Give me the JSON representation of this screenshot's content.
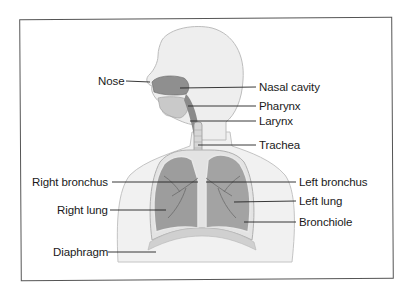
{
  "diagram": {
    "labels_left": [
      {
        "id": "nose",
        "text": "Nose",
        "x": 98,
        "y": 76
      },
      {
        "id": "right-bronchus",
        "text": "Right bronchus",
        "x": 32,
        "y": 176
      },
      {
        "id": "right-lung",
        "text": "Right lung",
        "x": 57,
        "y": 204
      },
      {
        "id": "diaphragm",
        "text": "Diaphragm",
        "x": 53,
        "y": 247
      }
    ],
    "labels_right": [
      {
        "id": "nasal-cavity",
        "text": "Nasal cavity",
        "x": 259,
        "y": 81
      },
      {
        "id": "pharynx",
        "text": "Pharynx",
        "x": 259,
        "y": 100
      },
      {
        "id": "larynx",
        "text": "Larynx",
        "x": 259,
        "y": 115
      },
      {
        "id": "trachea",
        "text": "Trachea",
        "x": 259,
        "y": 139
      },
      {
        "id": "left-bronchus",
        "text": "Left bronchus",
        "x": 299,
        "y": 176
      },
      {
        "id": "left-lung",
        "text": "Left lung",
        "x": 299,
        "y": 195
      },
      {
        "id": "bronchiole",
        "text": "Bronchiole",
        "x": 299,
        "y": 216
      }
    ],
    "colors": {
      "frame": "#555555",
      "leader_line": "#222222",
      "body_fill": "#efefef",
      "body_outline": "#b5b5b5",
      "lung_fill": "#9a9a9a",
      "text": "#1a1a1a"
    }
  }
}
